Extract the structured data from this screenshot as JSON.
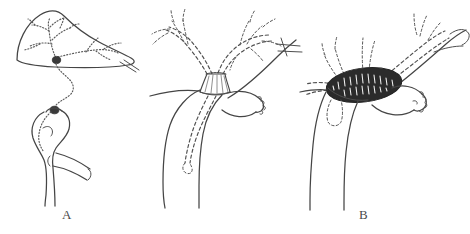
{
  "figure": {
    "kind": "medical-line-illustration",
    "background_color": "#ffffff",
    "ink_color": "#454545",
    "tumor_color": "#2b2b2b",
    "width_px": 470,
    "height_px": 234
  },
  "panels": [
    {
      "id": "a",
      "label": "A",
      "caption_position": {
        "x": 62,
        "y": 208
      },
      "elements": [
        {
          "name": "liver-outline",
          "type": "organ-outline",
          "style": "solid"
        },
        {
          "name": "intrahepatic-biliary-tree",
          "type": "duct-branching",
          "style": "stippled"
        },
        {
          "name": "hilar-nodule",
          "type": "lesion",
          "style": "filled-dark"
        },
        {
          "name": "common-bile-duct",
          "type": "duct",
          "style": "stippled-winding"
        },
        {
          "name": "distal-nodule",
          "type": "lesion",
          "style": "filled-dark"
        },
        {
          "name": "duodenal-loop",
          "type": "organ-outline",
          "style": "solid"
        },
        {
          "name": "pancreatic-segment",
          "type": "organ-outline",
          "style": "solid"
        },
        {
          "name": "hepatic-vessel-stub",
          "type": "vessel",
          "style": "solid"
        }
      ]
    },
    {
      "id": "b",
      "label": "B",
      "caption_position": {
        "x": 209,
        "y": 208
      },
      "elements": [
        {
          "name": "left-hepatic-duct-branches",
          "type": "duct-branching",
          "style": "dashed"
        },
        {
          "name": "right-hepatic-duct-branches",
          "type": "duct-branching",
          "style": "dashed"
        },
        {
          "name": "hilar-stricture-cuff",
          "type": "stricture",
          "style": "hatched"
        },
        {
          "name": "common-hepatic-duct",
          "type": "duct",
          "style": "dashed"
        },
        {
          "name": "duct-wall",
          "type": "organ-outline",
          "style": "solid"
        },
        {
          "name": "gallbladder",
          "type": "organ-outline",
          "style": "solid-scalloped"
        },
        {
          "name": "portal-vessel",
          "type": "vessel",
          "style": "solid"
        },
        {
          "name": "cystic-duct-terminus",
          "type": "duct-end",
          "style": "dashed-loop"
        }
      ]
    },
    {
      "id": "c",
      "label": "C",
      "caption_position": {
        "x": 380,
        "y": 208
      },
      "elements": [
        {
          "name": "hilar-tumor-mass",
          "type": "tumor",
          "style": "solid-dark-stippled"
        },
        {
          "name": "obstructed-left-ducts",
          "type": "duct-branching",
          "style": "dashed"
        },
        {
          "name": "obstructed-right-ducts",
          "type": "duct-branching",
          "style": "dashed"
        },
        {
          "name": "residual-duct-stump",
          "type": "duct-end",
          "style": "dashed-stub"
        },
        {
          "name": "duct-wall",
          "type": "organ-outline",
          "style": "solid"
        },
        {
          "name": "gallbladder",
          "type": "organ-outline",
          "style": "solid-scalloped"
        },
        {
          "name": "portal-vessel",
          "type": "vessel",
          "style": "solid"
        }
      ]
    }
  ]
}
